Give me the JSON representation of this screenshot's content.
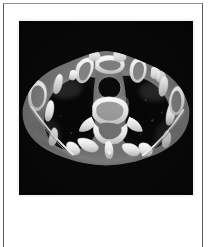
{
  "document": {
    "page_background": "#ffffff",
    "border_color": "#555a5e"
  },
  "figure": {
    "caption": "",
    "modality_label": "",
    "frame_color": "#f4f4f4",
    "background_color": "#050505"
  },
  "image_data": {
    "type": "medical-image",
    "modality": "CT",
    "plane": "axial",
    "body_region": "chest-upper-thorax",
    "window": "bone",
    "colormap": "grayscale",
    "background_color": "#050505",
    "soft_tissue_color": "#6c6c6c",
    "bone_color": "#f2f2f2",
    "air_color": "#070707",
    "structures": [
      {
        "name": "left-lung-field",
        "appearance": "air-dark"
      },
      {
        "name": "right-lung-field",
        "appearance": "air-dark"
      },
      {
        "name": "trachea",
        "appearance": "air-dark"
      },
      {
        "name": "thoracic-vertebra-body",
        "appearance": "bone-bright"
      },
      {
        "name": "spinous-process",
        "appearance": "bone-bright"
      },
      {
        "name": "sternum-manubrium",
        "appearance": "bone-bright"
      },
      {
        "name": "left-clavicle",
        "appearance": "bone-bright"
      },
      {
        "name": "right-clavicle",
        "appearance": "bone-bright"
      },
      {
        "name": "rib-cage",
        "appearance": "bone-bright"
      },
      {
        "name": "left-scapula",
        "appearance": "bone-bright"
      },
      {
        "name": "right-scapula",
        "appearance": "bone-bright"
      },
      {
        "name": "chest-wall-soft-tissue",
        "appearance": "mid-gray"
      },
      {
        "name": "mediastinum",
        "appearance": "mid-gray"
      }
    ]
  }
}
